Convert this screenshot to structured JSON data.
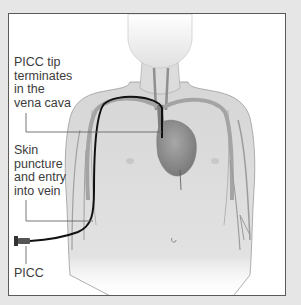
{
  "figure": {
    "labels": {
      "tip": "PICC tip\nterminates\nin the\nvena cava",
      "puncture": "Skin\npuncture\nand entry\ninto vein",
      "device": "PICC"
    },
    "colors": {
      "background": "#e6e6e6",
      "panel": "#ffffff",
      "border": "#5a5a5a",
      "body": "#dcdcdc",
      "vein": "#9a9a9a",
      "heart": "#8c8c8c",
      "catheter": "#111111",
      "text": "#3c3c3c"
    }
  }
}
